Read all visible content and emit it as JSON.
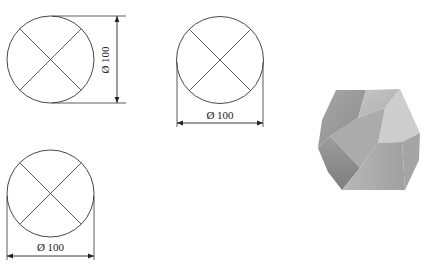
{
  "drawing": {
    "views": [
      {
        "id": "view-1",
        "label": "Ø 100",
        "dimension_orientation": "vertical",
        "circle": {
          "cx": 50.5,
          "cy": 59.5,
          "r": 43.5
        }
      },
      {
        "id": "view-2",
        "label": "Ø 100",
        "dimension_orientation": "horizontal",
        "circle": {
          "cx": 220,
          "cy": 60,
          "r": 43.5
        }
      },
      {
        "id": "view-3",
        "label": "Ø 100",
        "dimension_orientation": "horizontal",
        "circle": {
          "cx": 50.5,
          "cy": 193.5,
          "r": 43.5
        }
      }
    ],
    "render_3d": {
      "shape": "polyhedron",
      "fill_colors": [
        "#9a9a9a",
        "#b5b5b5",
        "#c8c8c8",
        "#8a8a8a",
        "#a8a8a8"
      ]
    },
    "line_color": "#333333"
  }
}
